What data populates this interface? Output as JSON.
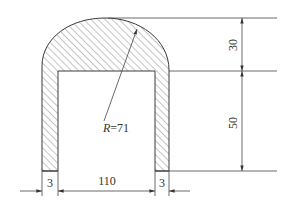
{
  "drawing": {
    "type": "cross-section",
    "dimensions": {
      "arch_height": "30",
      "wall_height": "50",
      "inner_width": "110",
      "left_wall_thickness": "3",
      "right_wall_thickness": "3",
      "radius_prefix": "R",
      "radius_eq": "=71"
    },
    "colors": {
      "line": "#3a3a3a",
      "hatch": "#555555",
      "background": "#ffffff"
    }
  }
}
